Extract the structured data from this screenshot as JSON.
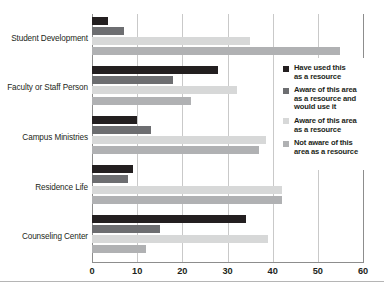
{
  "chart_data": {
    "type": "bar",
    "orientation": "horizontal",
    "title": "",
    "xlabel": "",
    "ylabel": "",
    "xlim": [
      0,
      60
    ],
    "xticks": [
      0,
      10,
      20,
      30,
      40,
      50,
      60
    ],
    "grid": true,
    "legend_position": "right",
    "categories": [
      "Student Development",
      "Faculty or Staff Person",
      "Campus Ministries",
      "Residence Life",
      "Counseling Center"
    ],
    "series": [
      {
        "name": "Have used this as a resource",
        "color": "#231f20",
        "values": [
          3.5,
          28,
          10,
          9,
          34
        ]
      },
      {
        "name": "Aware of this area as a resource and would use it",
        "color": "#6d6e71",
        "values": [
          7,
          18,
          13,
          8,
          15
        ]
      },
      {
        "name": "Aware of this area as a resource",
        "color": "#d7d8d8",
        "values": [
          35,
          32,
          38.5,
          42,
          39
        ]
      },
      {
        "name": "Not aware of this area as a resource",
        "color": "#b0b1b3",
        "values": [
          55,
          22,
          37,
          42,
          12
        ]
      }
    ]
  },
  "legend": {
    "items": [
      {
        "label_line1": "Have used this",
        "label_line2": "as a resource",
        "label_line3": "",
        "color": "#231f20"
      },
      {
        "label_line1": "Aware of this area",
        "label_line2": "as a resource and",
        "label_line3": "would use it",
        "color": "#6d6e71"
      },
      {
        "label_line1": "Aware of this area",
        "label_line2": "as a resource",
        "label_line3": "",
        "color": "#d7d8d8"
      },
      {
        "label_line1": "Not aware of this",
        "label_line2": "area as a resource",
        "label_line3": "",
        "color": "#b0b1b3"
      }
    ]
  },
  "axis": {
    "tick_labels": [
      "0",
      "10",
      "20",
      "30",
      "40",
      "50",
      "60"
    ],
    "gridline_color": "#c9c9c9",
    "axis_color": "#8d8d8d"
  }
}
